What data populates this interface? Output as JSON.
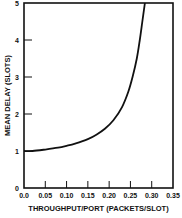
{
  "chart_data": {
    "type": "line",
    "title": "",
    "xlabel": "THROUGHPUT/PORT (PACKETS/SLOT)",
    "ylabel": "MEAN DELAY (SLOTS)",
    "xlim": [
      0,
      0.35
    ],
    "ylim": [
      0,
      5
    ],
    "x_ticks": [
      0.0,
      0.05,
      0.1,
      0.15,
      0.2,
      0.25,
      0.3,
      0.35
    ],
    "x_tick_labels": [
      "0.0",
      "0.05",
      "0.10",
      "0.15",
      "0.20",
      "0.25",
      "0.30",
      "0.35"
    ],
    "y_ticks": [
      0,
      1,
      2,
      3,
      4,
      5
    ],
    "y_tick_labels": [
      "0",
      "1",
      "2",
      "3",
      "4",
      "5"
    ],
    "grid": false,
    "legend": "none",
    "series": [
      {
        "name": "mean delay",
        "color": "#111111",
        "x": [
          0.0,
          0.02,
          0.05,
          0.08,
          0.1,
          0.12,
          0.15,
          0.17,
          0.19,
          0.21,
          0.23,
          0.245,
          0.255,
          0.265,
          0.272,
          0.278,
          0.284
        ],
        "y": [
          1.0,
          1.0,
          1.04,
          1.09,
          1.14,
          1.2,
          1.32,
          1.44,
          1.6,
          1.83,
          2.18,
          2.6,
          3.0,
          3.5,
          4.0,
          4.5,
          5.0
        ]
      }
    ]
  }
}
